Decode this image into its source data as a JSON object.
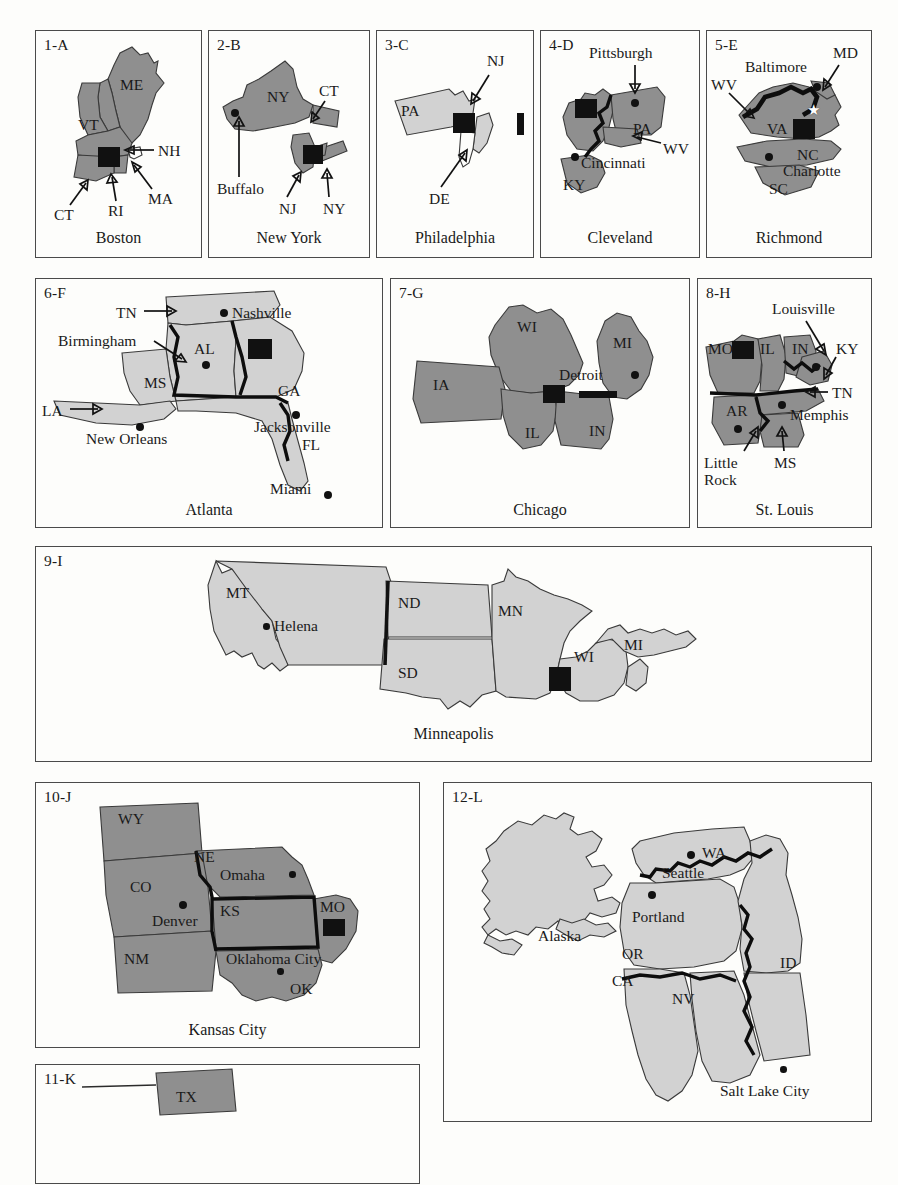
{
  "figure": {
    "type": "map-plate",
    "shade_dark": "#8f8f8f",
    "shade_light": "#d2d2d2",
    "marker_color": "#111111"
  },
  "panels": [
    {
      "id": "1-A",
      "caption": "Boston",
      "states": [
        "ME",
        "VT",
        "NH",
        "MA",
        "RI",
        "CT"
      ],
      "labels": [
        {
          "text": "ME"
        },
        {
          "text": "VT"
        },
        {
          "text": "NH"
        },
        {
          "text": "MA"
        },
        {
          "text": "RI"
        },
        {
          "text": "CT"
        },
        {
          "text": "Boston"
        }
      ],
      "arrow_labels": [
        "NH",
        "MA",
        "RI",
        "CT"
      ],
      "cities": [
        "Boston"
      ]
    },
    {
      "id": "2-B",
      "caption": "New York",
      "states": [
        "NY",
        "CT",
        "NJ"
      ],
      "labels": [
        {
          "text": "NY"
        },
        {
          "text": "CT"
        },
        {
          "text": "Buffalo"
        },
        {
          "text": "NJ"
        },
        {
          "text": "NY"
        }
      ],
      "arrow_labels": [
        "CT",
        "Buffalo",
        "NJ",
        "NY"
      ],
      "cities": [
        "Buffalo"
      ]
    },
    {
      "id": "3-C",
      "caption": "Philadelphia",
      "states": [
        "PA",
        "NJ",
        "DE"
      ],
      "labels": [
        {
          "text": "PA"
        },
        {
          "text": "NJ"
        },
        {
          "text": "DE"
        }
      ],
      "arrow_labels": [
        "NJ",
        "DE"
      ],
      "cities": []
    },
    {
      "id": "4-D",
      "caption": "Cleveland",
      "states": [
        "PA",
        "WV",
        "KY"
      ],
      "labels": [
        {
          "text": "Pittsburgh"
        },
        {
          "text": "PA"
        },
        {
          "text": "WV"
        },
        {
          "text": "Cincinnati"
        },
        {
          "text": "KY"
        }
      ],
      "arrow_labels": [
        "Pittsburgh",
        "WV"
      ],
      "cities": [
        "Pittsburgh",
        "Cincinnati"
      ]
    },
    {
      "id": "5-E",
      "caption": "Richmond",
      "states": [
        "WV",
        "MD",
        "VA",
        "NC",
        "SC"
      ],
      "labels": [
        {
          "text": "MD"
        },
        {
          "text": "Baltimore"
        },
        {
          "text": "WV"
        },
        {
          "text": "VA"
        },
        {
          "text": "NC"
        },
        {
          "text": "Charlotte"
        },
        {
          "text": "SC"
        }
      ],
      "arrow_labels": [
        "MD",
        "WV"
      ],
      "cities": [
        "Baltimore",
        "Charlotte"
      ]
    },
    {
      "id": "6-F",
      "caption": "Atlanta",
      "states": [
        "TN",
        "AL",
        "MS",
        "LA",
        "GA",
        "FL"
      ],
      "labels": [
        {
          "text": "TN"
        },
        {
          "text": "Nashville"
        },
        {
          "text": "Birmingham"
        },
        {
          "text": "AL"
        },
        {
          "text": "MS"
        },
        {
          "text": "GA"
        },
        {
          "text": "LA"
        },
        {
          "text": "New Orleans"
        },
        {
          "text": "Jacksonville"
        },
        {
          "text": "FL"
        },
        {
          "text": "Miami"
        }
      ],
      "arrow_labels": [
        "TN",
        "Birmingham",
        "LA"
      ],
      "cities": [
        "Nashville",
        "Birmingham",
        "New Orleans",
        "Jacksonville",
        "Miami"
      ]
    },
    {
      "id": "7-G",
      "caption": "Chicago",
      "states": [
        "WI",
        "MI",
        "IA",
        "IL",
        "IN"
      ],
      "labels": [
        {
          "text": "WI"
        },
        {
          "text": "MI"
        },
        {
          "text": "IA"
        },
        {
          "text": "Detroit"
        },
        {
          "text": "IL"
        },
        {
          "text": "IN"
        }
      ],
      "arrow_labels": [],
      "cities": [
        "Detroit"
      ]
    },
    {
      "id": "8-H",
      "caption": "St. Louis",
      "states": [
        "MO",
        "IL",
        "IN",
        "KY",
        "TN",
        "AR",
        "MS"
      ],
      "labels": [
        {
          "text": "Louisville"
        },
        {
          "text": "MO"
        },
        {
          "text": "IL"
        },
        {
          "text": "IN"
        },
        {
          "text": "KY"
        },
        {
          "text": "TN"
        },
        {
          "text": "AR"
        },
        {
          "text": "Memphis"
        },
        {
          "text": "Little"
        },
        {
          "text": "Rock"
        },
        {
          "text": "MS"
        }
      ],
      "arrow_labels": [
        "Louisville",
        "KY",
        "TN",
        "Little Rock",
        "MS"
      ],
      "cities": [
        "Louisville",
        "Memphis",
        "Little Rock"
      ]
    },
    {
      "id": "9-I",
      "caption": "Minneapolis",
      "states": [
        "MT",
        "ND",
        "MN",
        "SD",
        "WI",
        "MI"
      ],
      "labels": [
        {
          "text": "MT"
        },
        {
          "text": "ND"
        },
        {
          "text": "MN"
        },
        {
          "text": "Helena"
        },
        {
          "text": "SD"
        },
        {
          "text": "WI"
        },
        {
          "text": "MI"
        }
      ],
      "arrow_labels": [],
      "cities": [
        "Helena"
      ]
    },
    {
      "id": "10-J",
      "caption": "Kansas City",
      "states": [
        "WY",
        "NE",
        "CO",
        "KS",
        "MO",
        "NM",
        "OK"
      ],
      "labels": [
        {
          "text": "WY"
        },
        {
          "text": "NE"
        },
        {
          "text": "Omaha"
        },
        {
          "text": "CO"
        },
        {
          "text": "KS"
        },
        {
          "text": "MO"
        },
        {
          "text": "Denver"
        },
        {
          "text": "NM"
        },
        {
          "text": "Oklahoma City"
        },
        {
          "text": "OK"
        }
      ],
      "arrow_labels": [],
      "cities": [
        "Omaha",
        "Denver",
        "Oklahoma City"
      ]
    },
    {
      "id": "11-K",
      "caption": "",
      "states": [
        "TX"
      ],
      "labels": [
        {
          "text": "TX"
        }
      ],
      "arrow_labels": [],
      "cities": []
    },
    {
      "id": "12-L",
      "caption": "",
      "states": [
        "Alaska",
        "WA",
        "OR",
        "ID",
        "CA",
        "NV"
      ],
      "labels": [
        {
          "text": "Alaska"
        },
        {
          "text": "WA"
        },
        {
          "text": "Seattle"
        },
        {
          "text": "Portland"
        },
        {
          "text": "OR"
        },
        {
          "text": "ID"
        },
        {
          "text": "CA"
        },
        {
          "text": "NV"
        },
        {
          "text": "Salt Lake City"
        }
      ],
      "arrow_labels": [],
      "cities": [
        "Seattle",
        "Portland",
        "Salt Lake City"
      ]
    }
  ]
}
